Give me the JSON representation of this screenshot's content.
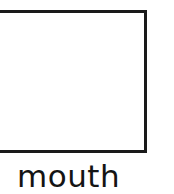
{
  "card": {
    "caption": "mouth",
    "drawing_box": {
      "content": "",
      "fill_color": "#ffffff",
      "border_color": "#1a1a1a"
    },
    "background_color": "#ffffff",
    "text_color": "#141414"
  }
}
